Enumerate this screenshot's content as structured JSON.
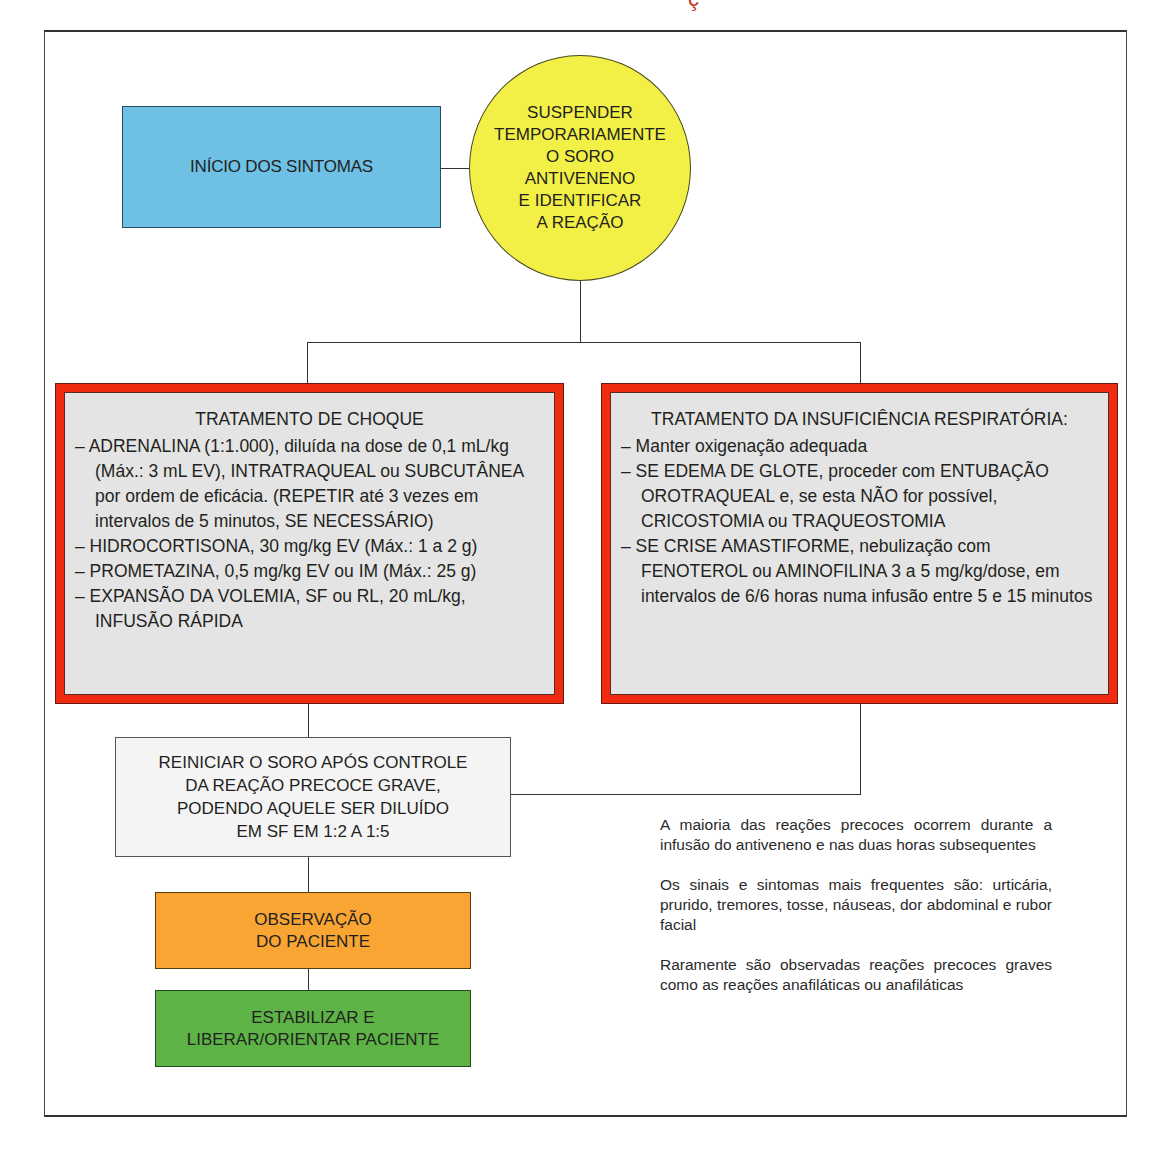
{
  "header": {
    "clipped_title_fragment": "ç"
  },
  "flowchart": {
    "start": {
      "label": "INÍCIO DOS SINTOMAS",
      "color": "#6ec1e4"
    },
    "suspend": {
      "lines": [
        "SUSPENDER",
        "TEMPORARIAMENTE",
        "O SORO",
        "ANTIVENENO",
        "E IDENTIFICAR",
        "A REAÇÃO"
      ],
      "color": "#f2ef46"
    },
    "shock_treatment": {
      "heading": "TRATAMENTO DE CHOQUE",
      "items": [
        "– ADRENALINA (1:1.000), diluída na dose de 0,1 mL/kg (Máx.: 3 mL EV), INTRATRAQUEAL ou SUBCUTÂNEA por ordem de eficácia. (REPETIR até 3 vezes em intervalos de 5 minutos, SE NECESSÁRIO)",
        "– HIDROCORTISONA, 30 mg/kg EV (Máx.: 1 a 2 g)",
        "– PROMETAZINA, 0,5 mg/kg EV ou IM (Máx.: 25 g)",
        "– EXPANSÃO DA VOLEMIA, SF ou RL, 20 mL/kg, INFUSÃO RÁPIDA"
      ],
      "border_color": "#ef2b12"
    },
    "respiratory_treatment": {
      "heading": "TRATAMENTO DA INSUFICIÊNCIA RESPIRATÓRIA:",
      "items": [
        "– Manter oxigenação adequada",
        "– SE EDEMA DE GLOTE, proceder com ENTUBAÇÃO OROTRAQUEAL e, se esta NÃO for possível, CRICOSTOMIA ou TRAQUEOSTOMIA",
        "– SE CRISE AMASTIFORME, nebulização com FENOTEROL ou AMINOFILINA 3 a 5 mg/kg/dose, em intervalos de 6/6 horas numa infusão entre 5 e 15 minutos"
      ],
      "border_color": "#ef2b12"
    },
    "restart": {
      "lines": [
        "REINICIAR O SORO APÓS CONTROLE",
        "DA REAÇÃO PRECOCE GRAVE,",
        "PODENDO AQUELE SER DILUÍDO",
        "EM SF EM 1:2 A 1:5"
      ]
    },
    "observe": {
      "lines": [
        "OBSERVAÇÃO",
        "DO PACIENTE"
      ],
      "color": "#f8a533"
    },
    "stabilize": {
      "lines": [
        "ESTABILIZAR E",
        "LIBERAR/ORIENTAR PACIENTE"
      ],
      "color": "#5db346"
    }
  },
  "notes": [
    "A maioria das reações precoces ocorrem durante a infusão do antiveneno e nas duas horas subsequentes",
    "Os sinais e sintomas mais frequentes são: urticária, prurido, tremores, tosse, náuseas, dor abdominal e rubor facial",
    "Raramente são observadas reações precoces graves como as reações anafiláticas ou anafiláticas"
  ]
}
